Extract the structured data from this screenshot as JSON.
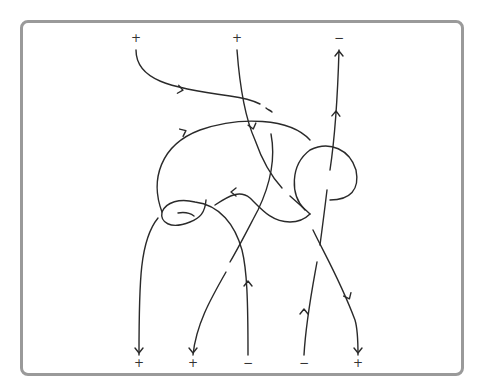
{
  "diagram": {
    "type": "oriented tangle diagram",
    "stroke_color": "#2a2a2a",
    "frame_color": "#9a9a9a",
    "top_labels": [
      {
        "text": "+",
        "x": 136,
        "y": 38
      },
      {
        "text": "+",
        "x": 237,
        "y": 38
      },
      {
        "text": "−",
        "x": 339,
        "y": 38
      }
    ],
    "bottom_labels": [
      {
        "text": "+",
        "x": 139,
        "y": 363
      },
      {
        "text": "+",
        "x": 193,
        "y": 363
      },
      {
        "text": "−",
        "x": 248,
        "y": 363
      },
      {
        "text": "−",
        "x": 304,
        "y": 363
      },
      {
        "text": "+",
        "x": 358,
        "y": 363
      }
    ],
    "strands": [
      {
        "name": "strand-1",
        "d": "M136,50 C136,80 170,88 230,96 C245,98 252,100 260,104"
      },
      {
        "name": "strand-1b",
        "d": "M266,108 C268,110 270,110 272,112"
      },
      {
        "name": "strand-2",
        "d": "M237,50 C240,90 246,120 255,140 C262,160 270,175 282,188"
      },
      {
        "name": "strand-2b",
        "d": "M290,196 C300,205 306,210 310,214"
      },
      {
        "name": "strand-2c",
        "d": "M313,230 C325,255 340,280 355,320 C358,330 358,345 358,355"
      },
      {
        "name": "strand-3",
        "d": "M339,50 C337,120 333,150 330,170"
      },
      {
        "name": "strand-3b",
        "d": "M327,190 C324,215 322,230 320,245"
      },
      {
        "name": "strand-3c",
        "d": "M317,262 C312,290 306,320 304,355"
      },
      {
        "name": "loop-big",
        "d": "M162,212 C150,180 160,145 200,130 C240,116 290,118 310,140"
      },
      {
        "name": "loop-right",
        "d": "M305,210 C290,195 290,165 310,150 C330,140 350,150 356,170 C360,190 350,200 330,200"
      },
      {
        "name": "strand-mid-a",
        "d": "M271,134 C276,160 270,185 258,210 C250,225 240,245 230,262"
      },
      {
        "name": "strand-mid-b",
        "d": "M226,272 C210,300 196,325 193,355"
      },
      {
        "name": "strand-arrow-left",
        "d": "M215,205 C230,195 240,190 250,198 C262,210 272,222 290,222 C300,222 306,218 310,214"
      },
      {
        "name": "strand-loop-small",
        "d": "M206,200 C205,213 200,218 190,222 C170,230 160,222 162,212 C166,202 180,198 195,202 C220,205 235,225 242,250 C247,270 248,300 248,355"
      },
      {
        "name": "strand-left-down",
        "d": "M158,218 C140,240 139,280 139,355"
      },
      {
        "name": "strand-small-arc",
        "d": "M178,213 C184,212 190,213 194,216"
      }
    ],
    "arrows": [
      {
        "name": "arrow-1",
        "x": 182,
        "y": 90,
        "angle": 10
      },
      {
        "name": "arrow-2",
        "x": 253,
        "y": 128,
        "angle": 75
      },
      {
        "name": "arrow-3",
        "x": 336,
        "y": 112,
        "angle": -88
      },
      {
        "name": "arrow-4",
        "x": 339,
        "y": 52,
        "angle": -90
      },
      {
        "name": "arrow-5",
        "x": 185,
        "y": 131,
        "angle": -25
      },
      {
        "name": "arrow-6",
        "x": 232,
        "y": 192,
        "angle": 180
      },
      {
        "name": "arrow-7",
        "x": 248,
        "y": 282,
        "angle": -90
      },
      {
        "name": "arrow-8",
        "x": 304,
        "y": 310,
        "angle": -90
      },
      {
        "name": "arrow-9",
        "x": 349,
        "y": 298,
        "angle": 65
      },
      {
        "name": "arrow-10",
        "x": 139,
        "y": 352,
        "angle": 90
      },
      {
        "name": "arrow-11",
        "x": 193,
        "y": 352,
        "angle": 90
      },
      {
        "name": "arrow-12",
        "x": 358,
        "y": 352,
        "angle": 90
      }
    ]
  }
}
